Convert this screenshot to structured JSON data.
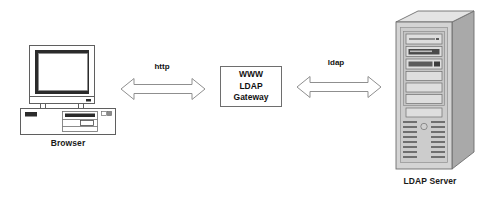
{
  "diagram": {
    "type": "block-diagram",
    "background_color": "#ffffff",
    "nodes": [
      {
        "id": "browser",
        "icon": "desktop-computer-icon",
        "label": "Browser",
        "shape": "computer-illustration"
      },
      {
        "id": "gateway",
        "icon": "rectangle-box",
        "shape": "rectangle",
        "border_color": "#6e6e6e",
        "fill_color": "#ffffff",
        "lines": [
          "WWW",
          "LDAP",
          "Gateway"
        ]
      },
      {
        "id": "ldap-server",
        "icon": "tower-server-icon",
        "label": "LDAP Server",
        "shape": "server-illustration"
      }
    ],
    "edges": [
      {
        "id": "browser-to-gateway",
        "label": "http",
        "style": "hollow-double-headed-arrow",
        "from": "browser",
        "to": "gateway",
        "stroke_color": "#8a8a8a"
      },
      {
        "id": "gateway-to-server",
        "label": "ldap",
        "style": "hollow-double-headed-arrow",
        "from": "gateway",
        "to": "ldap-server",
        "stroke_color": "#8a8a8a"
      }
    ],
    "colors": {
      "line": "#6e6e6e",
      "arrow_stroke": "#8a8a8a",
      "text": "#111111",
      "server_front": "#d2d2d2",
      "server_side": "#a8a8a8",
      "server_top": "#e2e2e2",
      "bezel_dark": "#2b2b2b",
      "screen_fill": "#ffffff"
    }
  }
}
